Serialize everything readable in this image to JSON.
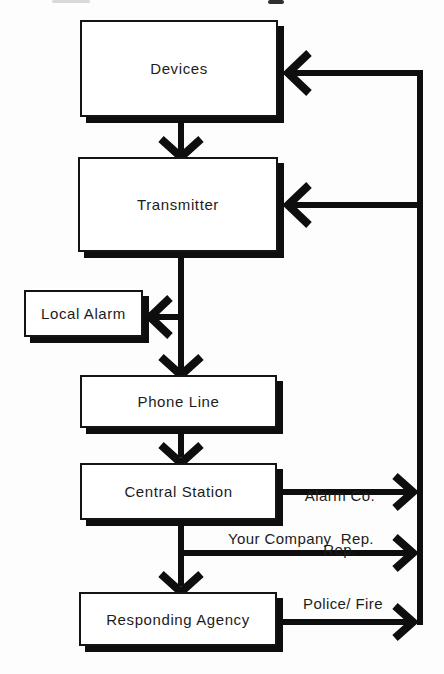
{
  "diagram": {
    "type": "flowchart",
    "boxes": {
      "devices": {
        "label": "Devices"
      },
      "transmitter": {
        "label": "Transmitter"
      },
      "local_alarm": {
        "label": "Local Alarm"
      },
      "phone_line": {
        "label": "Phone Line"
      },
      "central_station": {
        "label": "Central Station"
      },
      "responding_agency": {
        "label": "Responding Agency"
      }
    },
    "edge_labels": {
      "alarm_co_line1": "Alarm Co.",
      "alarm_co_line2": "Rep.",
      "your_company_rep": "Your Company  Rep.",
      "police_fire": "Police/ Fire"
    },
    "edges": [
      {
        "from": "devices",
        "to": "transmitter",
        "label": ""
      },
      {
        "from": "transmitter",
        "to": "local_alarm",
        "label": ""
      },
      {
        "from": "transmitter",
        "to": "phone_line",
        "label": ""
      },
      {
        "from": "phone_line",
        "to": "central_station",
        "label": ""
      },
      {
        "from": "central_station",
        "to": "responding_agency",
        "label": ""
      },
      {
        "from": "central_station",
        "to": "feedback_line",
        "label": "Alarm Co. Rep."
      },
      {
        "from": "central_station",
        "to": "feedback_line",
        "label": "Your Company Rep."
      },
      {
        "from": "responding_agency",
        "to": "feedback_line",
        "label": "Police/Fire"
      },
      {
        "from": "feedback_line",
        "to": "devices",
        "label": ""
      },
      {
        "from": "feedback_line",
        "to": "transmitter",
        "label": ""
      }
    ],
    "colors": {
      "ink": "#0e0e0e",
      "paper": "#fdfdfd"
    }
  }
}
